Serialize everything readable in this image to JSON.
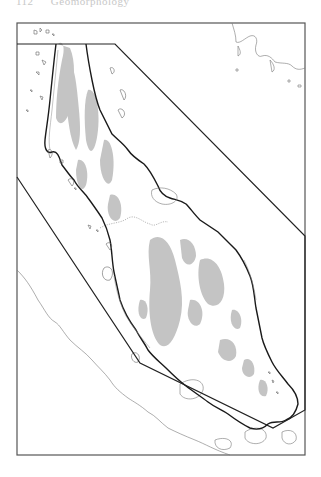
{
  "page": {
    "running_head": {
      "page_number": "112",
      "title": "Geomorphology"
    }
  },
  "map": {
    "subject": "Malay Peninsula",
    "frame": {
      "left": 17,
      "top": 23,
      "right": 305,
      "bottom": 455
    },
    "legend": [],
    "colors": {
      "frame": "#555555",
      "boundary_polygon": "#222222",
      "coastline_bold": "#1a1a1a",
      "coastline_thin": "#777777",
      "highland_fill": "#c4c4c4",
      "international_border": "#888888",
      "background": "#ffffff"
    },
    "features": [
      {
        "name": "boundary-polygon",
        "style": "bold line"
      },
      {
        "name": "peninsula-coastline",
        "style": "bold line"
      },
      {
        "name": "highlands",
        "style": "grey fill"
      },
      {
        "name": "sumatra-coastline",
        "style": "thin line"
      },
      {
        "name": "islands",
        "style": "thin outlines"
      },
      {
        "name": "international-border",
        "style": "dotted line"
      }
    ]
  }
}
